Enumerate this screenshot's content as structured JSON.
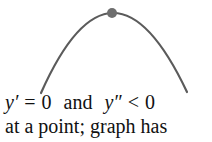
{
  "figure": {
    "background_color": "#ffffff",
    "curve": {
      "color": "#5b5b5b",
      "stroke_width": 2.2,
      "shape": "concave-down parabola",
      "apex_x": 112,
      "apex_y": 13,
      "left_end_x": 41,
      "left_end_y": 93,
      "right_end_x": 187,
      "right_end_y": 92
    },
    "point_marker": {
      "color": "#6e6e6e",
      "cx": 112,
      "cy": 13,
      "radius": 5,
      "label": "maximum-point"
    }
  },
  "caption": {
    "line1": {
      "var1": "y",
      "prime1": "′",
      "eq": "=",
      "zero1": "0",
      "conjunction": "and",
      "var2": "y",
      "prime2": "″",
      "lt": "<",
      "zero2": "0",
      "full_text": "y′ = 0 and y″ < 0"
    },
    "line2": {
      "text": "at a point; graph has"
    }
  }
}
